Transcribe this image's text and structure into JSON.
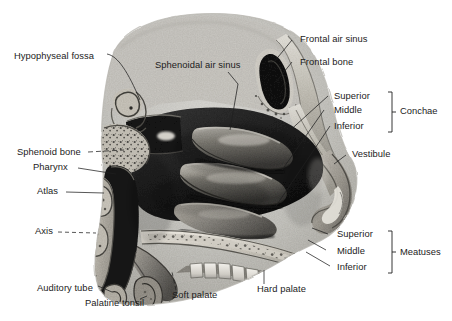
{
  "figure": {
    "kind": "anatomical-illustration",
    "style": "grayscale halftone engraving",
    "width": 452,
    "height": 321,
    "background_color": "#ffffff",
    "ink_color": "#1c1c1c"
  },
  "labels": {
    "hypophyseal_fossa": "Hypophyseal fossa",
    "sphenoidal_air_sinus": "Sphenoidal air sinus",
    "frontal_air_sinus": "Frontal air sinus",
    "frontal_bone": "Frontal bone",
    "vestibule": "Vestibule",
    "sphenoid_bone": "Sphenoid bone",
    "pharynx": "Pharynx",
    "atlas": "Atlas",
    "axis": "Axis",
    "auditory_tube": "Auditory tube",
    "palatine_tonsil": "Palatine tonsil",
    "soft_palate": "Soft palate",
    "hard_palate": "Hard palate"
  },
  "groups": {
    "conchae": {
      "title": "Conchae",
      "items": [
        "Superior",
        "Middle",
        "Inferior"
      ]
    },
    "meatuses": {
      "title": "Meatuses",
      "items": [
        "Superior",
        "Middle",
        "Inferior"
      ]
    }
  },
  "palette": {
    "skull_light": "#cdcdcd",
    "bone_mid": "#b4b0a8",
    "tissue_gray": "#8d8d8d",
    "cavity_dark": "#2a2a2a",
    "cavity_black": "#151515",
    "highlight": "#e8e6e1"
  }
}
